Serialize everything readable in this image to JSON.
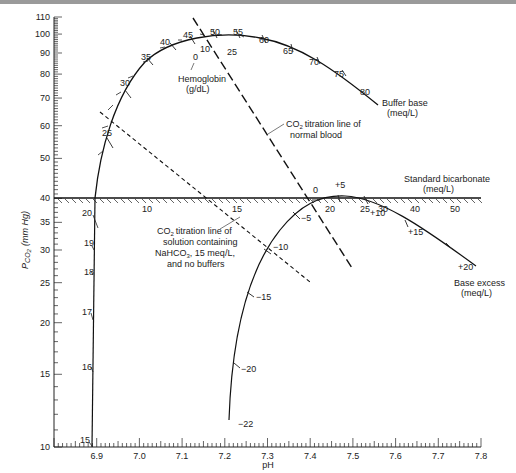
{
  "chart_data": {
    "type": "line",
    "xlabel": "pH",
    "ylabel": "PCO2 (mm Hg)",
    "x_scale": "linear",
    "y_scale": "log",
    "xlim": [
      6.8,
      7.8
    ],
    "ylim": [
      10,
      110
    ],
    "x_ticks": [
      "6.9",
      "7.0",
      "7.1",
      "7.2",
      "7.3",
      "7.4",
      "7.5",
      "7.6",
      "7.7",
      "7.8"
    ],
    "y_ticks": [
      "10",
      "15",
      "20",
      "25",
      "30",
      "35",
      "40",
      "50",
      "60",
      "70",
      "80",
      "90",
      "100",
      "110"
    ],
    "grid": false,
    "series": [
      {
        "name": "Buffer base (meq/L)",
        "type": "scale-curve",
        "tick_labels": [
          "25",
          "30",
          "35",
          "40",
          "45",
          "50",
          "55",
          "60",
          "65",
          "70",
          "75",
          "80"
        ]
      },
      {
        "name": "Hemoglobin (g/dL)",
        "type": "scale-on-buffer-base",
        "tick_labels": [
          "0",
          "10",
          "25"
        ]
      },
      {
        "name": "Standard bicarbonate (meq/L)",
        "type": "scale-horizontal-at-PCO2-40",
        "tick_labels": [
          "10",
          "15",
          "20",
          "25",
          "30",
          "40",
          "50"
        ]
      },
      {
        "name": "Base excess (meq/L)",
        "type": "scale-curve",
        "tick_labels": [
          "+20",
          "+15",
          "+10",
          "+5",
          "0",
          "-5",
          "-10",
          "-15",
          "-20",
          "-22"
        ]
      },
      {
        "name": "Left scale (PCO2 30-40 curve)",
        "type": "scale-curve",
        "tick_labels": [
          "15",
          "16",
          "17",
          "18",
          "19",
          "20"
        ]
      },
      {
        "name": "CO2 titration line of normal blood",
        "type": "dashed-line",
        "points": [
          {
            "pH": 7.17,
            "pco2": 105
          },
          {
            "pH": 7.52,
            "pco2": 26
          }
        ]
      },
      {
        "name": "CO2 titration line of solution containing NaHCO3, 15 meq/L, and no buffers",
        "type": "dashed-line",
        "points": [
          {
            "pH": 6.98,
            "pco2": 78
          },
          {
            "pH": 7.4,
            "pco2": 25
          }
        ]
      }
    ],
    "annotations": [
      "Buffer base (meq/L)",
      "Hemoglobin (g/dL)",
      "CO2 titration line of normal blood",
      "Standard bicarbonate (meq/L)",
      "CO2 titration line of solution containing NaHCO3, 15 meq/L, and no buffers",
      "Base excess (meq/L)"
    ]
  },
  "labels": {
    "x_axis": "pH",
    "y_axis_main": "P",
    "y_axis_sub": "CO",
    "y_axis_sub2": "2",
    "y_axis_units": "(mm Hg)",
    "buffer_base_1": "Buffer base",
    "buffer_base_2": "(meq/L)",
    "hemoglobin_1": "Hemoglobin",
    "hemoglobin_2": "(g/dL)",
    "normal_blood_1": "CO",
    "normal_blood_1b": "titration line of",
    "normal_blood_2": "normal blood",
    "std_bicarb_1": "Standard bicarbonate",
    "std_bicarb_2": "(meq/L)",
    "nahco3_1": "titration line of",
    "nahco3_2": "solution containing",
    "nahco3_3": "NaHCO",
    "nahco3_3b": ", 15 meq/L,",
    "nahco3_4": "and no buffers",
    "base_excess_1": "Base excess",
    "base_excess_2": "(meq/L)",
    "sub2": "2",
    "sub3": "3"
  }
}
